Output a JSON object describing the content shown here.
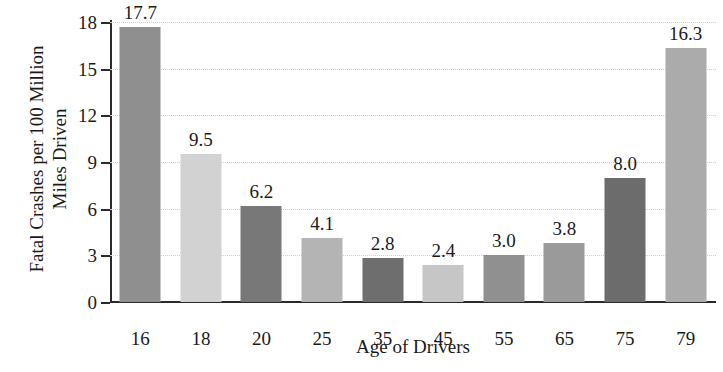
{
  "chart_data": {
    "type": "bar",
    "title": "",
    "categories": [
      "16",
      "18",
      "20",
      "25",
      "35",
      "45",
      "55",
      "65",
      "75",
      "79"
    ],
    "values": [
      17.7,
      9.5,
      6.2,
      4.1,
      2.8,
      2.4,
      3.0,
      3.8,
      8.0,
      16.3
    ],
    "value_labels": [
      "17.7",
      "9.5",
      "6.2",
      "4.1",
      "2.8",
      "2.4",
      "3.0",
      "3.8",
      "8.0",
      "16.3"
    ],
    "bar_colors": [
      "#8f8f8f",
      "#d2d2d2",
      "#787878",
      "#b4b4b4",
      "#6e6e6e",
      "#c6c6c6",
      "#909090",
      "#9a9a9a",
      "#6c6c6c",
      "#ababab"
    ],
    "xlabel": "Age of Drivers",
    "ylabel_lines": [
      "Fatal Crashes per 100 Million",
      "Miles Driven"
    ],
    "ylabel": "Fatal Crashes per 100 Million Miles Driven",
    "ytick_labels": [
      "0",
      "3",
      "6",
      "9",
      "12",
      "15",
      "18"
    ],
    "ytick_values": [
      0,
      3,
      6,
      9,
      12,
      15,
      18
    ],
    "ylim": [
      0,
      18
    ],
    "grid": true,
    "grid_axis": "y",
    "legend": "none",
    "axis_color": "#2a2a2a",
    "grid_color": "#cfcfcf",
    "background": "#ffffff"
  }
}
